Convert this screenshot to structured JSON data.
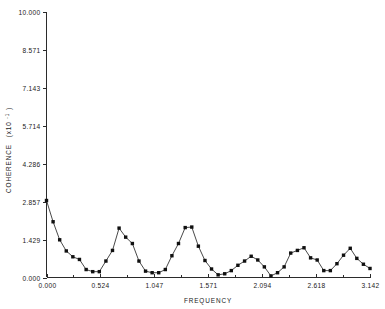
{
  "chart_data": {
    "type": "line",
    "title": "",
    "xlabel": "FREQUENCY",
    "ylabel": "COHERENCE",
    "ylabel_scale": "(x10",
    "ylabel_exponent": "-1",
    "ylabel_scale_close": ")",
    "xlim": [
      0.0,
      3.142
    ],
    "ylim": [
      0.0,
      10.0
    ],
    "grid": false,
    "legend": null,
    "marker": "square",
    "xticks": [
      "0.000",
      "0.524",
      "1.047",
      "1.571",
      "2.094",
      "2.618",
      "3.142"
    ],
    "xtick_values": [
      0.0,
      0.524,
      1.047,
      1.571,
      2.094,
      2.618,
      3.142
    ],
    "xminor_count": 1,
    "yticks": [
      "0.000",
      "1.429",
      "2.857",
      "4.286",
      "5.714",
      "7.143",
      "8.571",
      "10.000"
    ],
    "ytick_values": [
      0.0,
      1.429,
      2.857,
      4.286,
      5.714,
      7.143,
      8.571,
      10.0
    ],
    "x": [
      0.0,
      0.064,
      0.128,
      0.192,
      0.256,
      0.32,
      0.385,
      0.449,
      0.513,
      0.577,
      0.641,
      0.705,
      0.769,
      0.834,
      0.898,
      0.962,
      1.026,
      1.09,
      1.154,
      1.218,
      1.282,
      1.347,
      1.411,
      1.475,
      1.539,
      1.603,
      1.667,
      1.731,
      1.795,
      1.859,
      1.924,
      1.988,
      2.052,
      2.116,
      2.18,
      2.244,
      2.308,
      2.372,
      2.437,
      2.501,
      2.565,
      2.629,
      2.693,
      2.757,
      2.821,
      2.885,
      2.95,
      3.014,
      3.078,
      3.142
    ],
    "y": [
      2.9,
      2.1,
      1.42,
      1.0,
      0.78,
      0.68,
      0.3,
      0.22,
      0.22,
      0.62,
      1.02,
      1.86,
      1.52,
      1.28,
      0.62,
      0.24,
      0.18,
      0.18,
      0.3,
      0.82,
      1.28,
      1.88,
      1.9,
      1.18,
      0.64,
      0.32,
      0.1,
      0.14,
      0.26,
      0.46,
      0.62,
      0.8,
      0.66,
      0.4,
      0.06,
      0.18,
      0.4,
      0.92,
      1.02,
      1.12,
      0.74,
      0.66,
      0.26,
      0.26,
      0.52,
      0.84,
      1.1,
      0.72,
      0.5,
      0.34
    ]
  }
}
